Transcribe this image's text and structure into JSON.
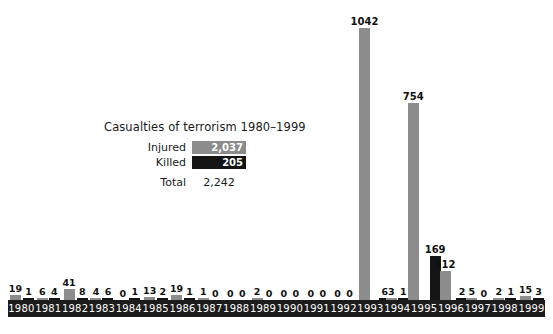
{
  "legend": {
    "title": "Casualties of terrorism 1980–1999",
    "injured_label": "Injured",
    "injured_total": "2,037",
    "killed_label": "Killed",
    "killed_total": "205",
    "total_label": "Total",
    "total_value": "2,242"
  },
  "colors": {
    "injured": "#8c8c8c",
    "killed": "#141414",
    "axis_band": "#1c1c1c",
    "background": "#ffffff",
    "text": "#1a1a1a"
  },
  "chart_data": {
    "type": "bar",
    "title": "Casualties of terrorism 1980–1999",
    "xlabel": "",
    "ylabel": "",
    "ylim": [
      0,
      1042
    ],
    "grid": false,
    "legend_position": "inside-left",
    "categories": [
      "1980",
      "1981",
      "1982",
      "1983",
      "1984",
      "1985",
      "1986",
      "1987",
      "1988",
      "1989",
      "1990",
      "1991",
      "1992",
      "1993",
      "1994",
      "1995",
      "1996",
      "1997",
      "1998",
      "1999"
    ],
    "series": [
      {
        "name": "Injured",
        "color": "#8c8c8c",
        "total": 2037,
        "values": [
          19,
          6,
          41,
          4,
          0,
          13,
          19,
          1,
          0,
          2,
          0,
          0,
          0,
          1042,
          3,
          754,
          112,
          5,
          2,
          15
        ]
      },
      {
        "name": "Killed",
        "color": "#141414",
        "total": 205,
        "values": [
          1,
          4,
          8,
          6,
          1,
          2,
          1,
          0,
          0,
          0,
          0,
          0,
          0,
          6,
          1,
          169,
          2,
          0,
          1,
          3
        ]
      }
    ],
    "grand_total": 2242,
    "annotations": [
      "1042",
      "754",
      "169",
      "112",
      "41",
      "19",
      "15",
      "13"
    ]
  }
}
